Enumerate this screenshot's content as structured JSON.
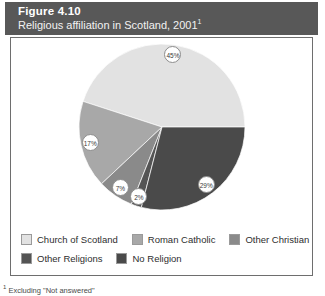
{
  "figure": {
    "number": "Figure 4.10",
    "subtitle": "Religious affiliation in Scotland, 2001",
    "subtitle_superscript": "1",
    "footnote_marker": "1",
    "footnote": " Excluding \"Not answered\""
  },
  "legend": {
    "rows": [
      [
        {
          "label": "Church of Scotland",
          "color": "#e2e2e2"
        },
        {
          "label": "Roman Catholic",
          "color": "#a8a8a8"
        },
        {
          "label": "Other Christian",
          "color": "#8a8a8a"
        }
      ],
      [
        {
          "label": "Other Religions",
          "color": "#545454"
        },
        {
          "label": "No Religion",
          "color": "#4a4a4a"
        }
      ]
    ]
  },
  "chart_data": {
    "type": "pie",
    "title": "Religious affiliation in Scotland, 2001",
    "unit": "percent",
    "labels": [
      "Church of Scotland",
      "Roman Catholic",
      "Other Christian",
      "Other Religions",
      "No Religion"
    ],
    "values": [
      45,
      17,
      7,
      2,
      29
    ],
    "value_labels": [
      "45%",
      "17%",
      "7%",
      "2%",
      "29%"
    ],
    "colors": [
      "#e2e2e2",
      "#a8a8a8",
      "#8a8a8a",
      "#545454",
      "#4a4a4a"
    ],
    "legend_position": "bottom",
    "grid": false,
    "start_angle_deg": 0,
    "direction": "counterclockwise",
    "slices": [
      {
        "label": "Church of Scotland",
        "value": 45,
        "value_label": "45%",
        "color": "#e2e2e2"
      },
      {
        "label": "Roman Catholic",
        "value": 17,
        "value_label": "17%",
        "color": "#a8a8a8"
      },
      {
        "label": "Other Christian",
        "value": 7,
        "value_label": "7%",
        "color": "#8a8a8a"
      },
      {
        "label": "Other Religions",
        "value": 2,
        "value_label": "2%",
        "color": "#545454"
      },
      {
        "label": "No Religion",
        "value": 29,
        "value_label": "29%",
        "color": "#4a4a4a"
      }
    ]
  }
}
